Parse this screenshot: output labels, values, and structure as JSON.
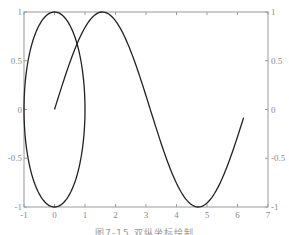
{
  "chart_data": {
    "type": "line",
    "title": "",
    "xlabel": "",
    "ylabel": "",
    "ylabel_right": "",
    "xlim": [
      -1,
      7
    ],
    "ylim": [
      -1,
      1
    ],
    "ylim_right": [
      -1,
      1
    ],
    "grid": false,
    "legend": null,
    "x_ticks": [
      "-1",
      "0",
      "1",
      "2",
      "3",
      "4",
      "5",
      "6",
      "7"
    ],
    "y_ticks_left": [
      "-1",
      "-0.5",
      "0",
      "0.5",
      "1"
    ],
    "y_ticks_right": [
      "-1",
      "-0.5",
      "0",
      "0.5",
      "1"
    ],
    "series": [
      {
        "name": "circle (cos t, sin t)",
        "axis": "left",
        "param": "t from 0 to 2π",
        "x_expr": "cos(t)",
        "y_expr": "sin(t)",
        "color": "#222222"
      },
      {
        "name": "sin(t)",
        "axis": "right",
        "param": "t from 0 to 6.2",
        "x_expr": "t",
        "y_expr": "sin(t)",
        "color": "#222222"
      }
    ],
    "caption": "图7-15  双纵坐标绘制"
  },
  "caption": "图7-15  双纵坐标绘制"
}
